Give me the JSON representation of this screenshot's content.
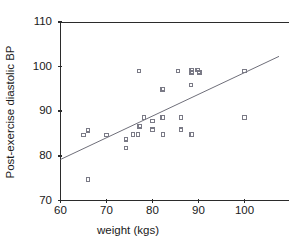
{
  "chart_data": {
    "type": "scatter",
    "title": "",
    "xlabel": "weight (kgs)",
    "ylabel": "Post-exercise diastolic BP",
    "xlim": [
      60,
      107.5
    ],
    "ylim": [
      70,
      110
    ],
    "xticks": [
      60,
      70,
      80,
      90,
      100
    ],
    "xticklabels": [
      "60",
      "70",
      "80",
      "90",
      "100"
    ],
    "yticks": [
      70,
      80,
      90,
      100,
      110
    ],
    "yticklabels": [
      "70",
      "80",
      "90",
      "100",
      "110"
    ],
    "grid": false,
    "legend": null,
    "marker": "open-square",
    "marker_color": "#7a7a86",
    "points": [
      {
        "x": 65.0,
        "y": 84.7
      },
      {
        "x": 66.0,
        "y": 85.7
      },
      {
        "x": 66.0,
        "y": 74.7
      },
      {
        "x": 70.0,
        "y": 84.7
      },
      {
        "x": 74.2,
        "y": 83.7
      },
      {
        "x": 74.2,
        "y": 81.8
      },
      {
        "x": 75.8,
        "y": 84.8
      },
      {
        "x": 76.8,
        "y": 84.8
      },
      {
        "x": 77.0,
        "y": 99.0
      },
      {
        "x": 77.2,
        "y": 86.6
      },
      {
        "x": 78.2,
        "y": 88.6
      },
      {
        "x": 80.0,
        "y": 87.8
      },
      {
        "x": 80.0,
        "y": 85.9
      },
      {
        "x": 82.2,
        "y": 94.9
      },
      {
        "x": 82.2,
        "y": 88.6
      },
      {
        "x": 82.3,
        "y": 84.8
      },
      {
        "x": 85.5,
        "y": 99.0
      },
      {
        "x": 86.2,
        "y": 88.6
      },
      {
        "x": 86.2,
        "y": 85.9
      },
      {
        "x": 88.3,
        "y": 95.9
      },
      {
        "x": 88.5,
        "y": 99.3
      },
      {
        "x": 88.5,
        "y": 98.7
      },
      {
        "x": 88.5,
        "y": 84.8
      },
      {
        "x": 89.8,
        "y": 99.3
      },
      {
        "x": 90.2,
        "y": 98.7
      },
      {
        "x": 100.0,
        "y": 99.0
      },
      {
        "x": 100.0,
        "y": 88.6
      }
    ],
    "fit_line": {
      "x_start": 60.0,
      "y_start": 79.2,
      "x_end": 107.5,
      "y_end": 102.3,
      "color": "#6f6f7a"
    }
  }
}
